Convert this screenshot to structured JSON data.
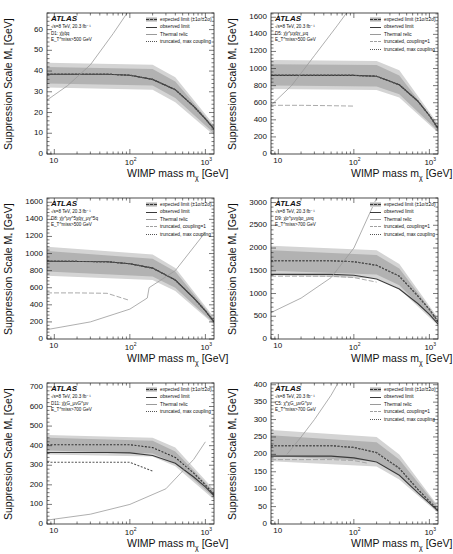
{
  "chart_data": [
    {
      "type": "line",
      "panel": "D1",
      "title": "",
      "atlas_label": "ATLAS",
      "info_lines": [
        "√s=8 TeV, 20.3 fb⁻¹",
        "D1: χ̄χq̄q",
        "E_T^miss>500 GeV"
      ],
      "xlabel": "WIMP mass m_χ [GeV]",
      "ylabel": "Suppression Scale M* [GeV]",
      "xscale": "log",
      "xlim": [
        8,
        1300
      ],
      "ylim": [
        0,
        68
      ],
      "xticks": [
        "10",
        "10²",
        "10³"
      ],
      "yticks": [
        0,
        10,
        20,
        30,
        40,
        50,
        60
      ],
      "legend": [
        "expected limit (±1σ/±2σ)",
        "observed limit",
        "Thermal relic",
        "truncated, max coupling"
      ],
      "series": [
        {
          "name": "expected limit",
          "x": [
            8,
            10,
            50,
            100,
            200,
            400,
            700,
            1000,
            1300
          ],
          "values": [
            38.5,
            38.5,
            38.5,
            38,
            36,
            31,
            23,
            17,
            12
          ]
        },
        {
          "name": "observed limit",
          "x": [
            8,
            10,
            50,
            100,
            200,
            400,
            700,
            1000,
            1300
          ],
          "values": [
            38.5,
            38.5,
            38.5,
            38,
            36,
            31,
            23,
            17,
            12
          ]
        },
        {
          "name": "truncated, max coupling",
          "x": [
            8,
            10,
            50,
            100,
            200,
            400,
            700,
            1000,
            1300
          ],
          "values": [
            38.5,
            38.5,
            38.5,
            38,
            36,
            31,
            23,
            17,
            12
          ]
        },
        {
          "name": "Thermal relic",
          "x": [
            8,
            15,
            30,
            60,
            100
          ],
          "values": [
            26,
            33,
            43,
            58,
            70
          ]
        }
      ],
      "band_1sigma": {
        "x": [
          8,
          200,
          400,
          1300
        ],
        "upper": [
          42,
          41,
          35,
          13
        ],
        "lower": [
          34,
          33,
          27,
          10
        ]
      },
      "band_2sigma": {
        "x": [
          8,
          200,
          400,
          1300
        ],
        "upper": [
          44,
          43,
          37,
          14
        ],
        "lower": [
          32,
          31,
          25,
          9
        ]
      }
    },
    {
      "type": "line",
      "panel": "D5",
      "atlas_label": "ATLAS",
      "info_lines": [
        "√s=8 TeV, 20.3 fb⁻¹",
        "D5: χ̄γ^μχq̄γ_μq",
        "E_T^miss>500 GeV"
      ],
      "xlabel": "WIMP mass m_χ [GeV]",
      "ylabel": "Suppression Scale M* [GeV]",
      "xscale": "log",
      "xlim": [
        8,
        1300
      ],
      "ylim": [
        0,
        1650
      ],
      "xticks": [
        "10",
        "10²",
        "10³"
      ],
      "yticks": [
        0,
        200,
        400,
        600,
        800,
        1000,
        1200,
        1400,
        1600
      ],
      "legend": [
        "expected limit (±1σ/±2σ)",
        "observed limit",
        "Thermal relic",
        "truncated, coupling=1",
        "truncated, max coupling"
      ],
      "series": [
        {
          "name": "expected limit",
          "x": [
            8,
            10,
            50,
            100,
            200,
            400,
            700,
            1000,
            1300
          ],
          "values": [
            920,
            920,
            920,
            920,
            910,
            810,
            620,
            450,
            300
          ]
        },
        {
          "name": "observed limit",
          "x": [
            8,
            10,
            50,
            100,
            200,
            400,
            700,
            1000,
            1300
          ],
          "values": [
            920,
            920,
            920,
            920,
            910,
            810,
            620,
            450,
            300
          ]
        },
        {
          "name": "truncated, coupling=1",
          "x": [
            8,
            20,
            50,
            100
          ],
          "values": [
            570,
            570,
            565,
            560
          ]
        },
        {
          "name": "truncated, max coupling",
          "x": [
            8,
            10,
            50,
            100,
            200,
            400,
            700,
            1000,
            1300
          ],
          "values": [
            920,
            920,
            920,
            920,
            910,
            810,
            620,
            450,
            300
          ]
        },
        {
          "name": "Thermal relic",
          "x": [
            8,
            15,
            30,
            60,
            80
          ],
          "values": [
            570,
            800,
            1150,
            1500,
            1650
          ]
        }
      ],
      "band_1sigma": {
        "x": [
          8,
          200,
          400,
          1300
        ],
        "upper": [
          1050,
          1040,
          920,
          330
        ],
        "lower": [
          800,
          790,
          700,
          270
        ]
      },
      "band_2sigma": {
        "x": [
          8,
          200,
          400,
          1300
        ],
        "upper": [
          1100,
          1090,
          980,
          350
        ],
        "lower": [
          760,
          750,
          660,
          250
        ]
      }
    },
    {
      "type": "line",
      "panel": "D8",
      "atlas_label": "ATLAS",
      "info_lines": [
        "√s=8 TeV, 20.3 fb⁻¹",
        "D8: χ̄γ^μγ^5χq̄γ_μγ^5q",
        "E_T^miss>500 GeV"
      ],
      "xlabel": "WIMP mass m_χ [GeV]",
      "ylabel": "Suppression Scale M* [GeV]",
      "xscale": "log",
      "xlim": [
        8,
        1300
      ],
      "ylim": [
        0,
        1650
      ],
      "xticks": [
        "10",
        "10²",
        "10³"
      ],
      "yticks": [
        0,
        200,
        400,
        600,
        800,
        1000,
        1200,
        1400,
        1600
      ],
      "legend": [
        "expected limit (±1σ/±2σ)",
        "observed limit",
        "Thermal relic",
        "truncated, coupling=1",
        "truncated, max coupling"
      ],
      "series": [
        {
          "name": "expected limit",
          "x": [
            8,
            10,
            50,
            100,
            200,
            400,
            700,
            1000,
            1300
          ],
          "values": [
            910,
            910,
            905,
            880,
            830,
            690,
            480,
            330,
            200
          ]
        },
        {
          "name": "observed limit",
          "x": [
            8,
            10,
            50,
            100,
            200,
            400,
            700,
            1000,
            1300
          ],
          "values": [
            910,
            910,
            905,
            880,
            830,
            690,
            480,
            330,
            200
          ]
        },
        {
          "name": "truncated, coupling=1",
          "x": [
            8,
            20,
            50,
            100
          ],
          "values": [
            540,
            540,
            535,
            450
          ]
        },
        {
          "name": "truncated, max coupling",
          "x": [
            8,
            10,
            50,
            100,
            200,
            400,
            700,
            1000,
            1300
          ],
          "values": [
            910,
            910,
            905,
            880,
            830,
            690,
            480,
            330,
            200
          ]
        },
        {
          "name": "Thermal relic",
          "x": [
            8,
            30,
            100,
            170,
            180,
            400,
            1000
          ],
          "values": [
            110,
            200,
            350,
            480,
            600,
            800,
            1250
          ]
        }
      ],
      "band_1sigma": {
        "x": [
          8,
          200,
          400,
          1300
        ],
        "upper": [
          1030,
          940,
          790,
          230
        ],
        "lower": [
          790,
          730,
          600,
          180
        ]
      },
      "band_2sigma": {
        "x": [
          8,
          200,
          400,
          1300
        ],
        "upper": [
          1080,
          990,
          830,
          250
        ],
        "lower": [
          740,
          690,
          560,
          170
        ]
      }
    },
    {
      "type": "line",
      "panel": "D9",
      "atlas_label": "ATLAS",
      "info_lines": [
        "√s=8 TeV, 20.3 fb⁻¹",
        "D9: χ̄σ^μνχq̄σ_μνq",
        "E_T^miss>700 GeV"
      ],
      "xlabel": "WIMP mass m_χ [GeV]",
      "ylabel": "Suppression Scale M* [GeV]",
      "xscale": "log",
      "xlim": [
        8,
        1300
      ],
      "ylim": [
        0,
        3100
      ],
      "xticks": [
        "10",
        "10²",
        "10³"
      ],
      "yticks": [
        0,
        500,
        1000,
        1500,
        2000,
        2500,
        3000
      ],
      "legend": [
        "expected limit (±1σ/±2σ)",
        "observed limit",
        "Thermal relic",
        "truncated, coupling=1",
        "truncated, max coupling"
      ],
      "series": [
        {
          "name": "expected limit",
          "x": [
            8,
            10,
            50,
            100,
            200,
            400,
            700,
            1000,
            1300
          ],
          "values": [
            1720,
            1720,
            1720,
            1700,
            1620,
            1380,
            950,
            650,
            380
          ]
        },
        {
          "name": "observed limit",
          "x": [
            8,
            10,
            50,
            100,
            200,
            400,
            700,
            1000,
            1300
          ],
          "values": [
            1420,
            1420,
            1420,
            1400,
            1320,
            1100,
            780,
            540,
            330
          ]
        },
        {
          "name": "truncated, coupling=1",
          "x": [
            8,
            20,
            50,
            100,
            200
          ],
          "values": [
            1380,
            1380,
            1380,
            1350,
            1250
          ]
        },
        {
          "name": "truncated, max coupling",
          "x": [
            8,
            10,
            50,
            100,
            200,
            400,
            700,
            1000,
            1300
          ],
          "values": [
            1720,
            1720,
            1720,
            1700,
            1620,
            1380,
            950,
            650,
            380
          ]
        },
        {
          "name": "Thermal relic",
          "x": [
            8,
            20,
            50,
            100,
            200
          ],
          "values": [
            580,
            900,
            1350,
            2000,
            3100
          ]
        }
      ],
      "band_1sigma": {
        "x": [
          8,
          200,
          400,
          1300
        ],
        "upper": [
          1950,
          1850,
          1550,
          430
        ],
        "lower": [
          1500,
          1420,
          1180,
          330
        ]
      },
      "band_2sigma": {
        "x": [
          8,
          200,
          400,
          1300
        ],
        "upper": [
          2050,
          1950,
          1650,
          460
        ],
        "lower": [
          1400,
          1330,
          1100,
          300
        ]
      }
    },
    {
      "type": "line",
      "panel": "D11",
      "atlas_label": "ATLAS",
      "info_lines": [
        "√s=8 TeV, 20.3 fb⁻¹",
        "D11: χ̄χG_μνG^μν",
        "E_T^miss>700 GeV"
      ],
      "xlabel": "WIMP mass m_χ [GeV]",
      "ylabel": "Suppression Scale M* [GeV]",
      "xscale": "log",
      "xlim": [
        8,
        1300
      ],
      "ylim": [
        0,
        720
      ],
      "xticks": [
        "10",
        "10²",
        "10³"
      ],
      "yticks": [
        0,
        100,
        200,
        300,
        400,
        500,
        600,
        700
      ],
      "legend": [
        "expected limit (±1σ/±2σ)",
        "observed limit",
        "Thermal relic",
        "truncated, max coupling"
      ],
      "series": [
        {
          "name": "expected limit",
          "x": [
            8,
            10,
            50,
            100,
            200,
            400,
            700,
            1000,
            1300
          ],
          "values": [
            405,
            405,
            405,
            405,
            390,
            340,
            260,
            200,
            150
          ]
        },
        {
          "name": "observed limit",
          "x": [
            8,
            10,
            50,
            100,
            200,
            400,
            700,
            1000,
            1300
          ],
          "values": [
            365,
            365,
            365,
            363,
            350,
            310,
            240,
            190,
            145
          ]
        },
        {
          "name": "truncated, max coupling",
          "x": [
            8,
            20,
            50,
            100,
            200
          ],
          "values": [
            315,
            315,
            315,
            315,
            270
          ]
        },
        {
          "name": "Thermal relic",
          "x": [
            8,
            30,
            100,
            300,
            700,
            1000
          ],
          "values": [
            20,
            50,
            100,
            180,
            330,
            420
          ]
        }
      ],
      "band_1sigma": {
        "x": [
          8,
          200,
          400,
          1300
        ],
        "upper": [
          440,
          425,
          370,
          165
        ],
        "lower": [
          375,
          360,
          310,
          135
        ]
      },
      "band_2sigma": {
        "x": [
          8,
          200,
          400,
          1300
        ],
        "upper": [
          455,
          440,
          390,
          175
        ],
        "lower": [
          355,
          345,
          295,
          125
        ]
      }
    },
    {
      "type": "line",
      "panel": "C5",
      "atlas_label": "ATLAS",
      "info_lines": [
        "√s=8 TeV, 20.3 fb⁻¹",
        "C5: χ*χG_μνG^μν",
        "E_T^miss>700 GeV"
      ],
      "xlabel": "WIMP mass m_χ [GeV]",
      "ylabel": "Suppression Scale M* [GeV]",
      "xscale": "log",
      "xlim": [
        8,
        1300
      ],
      "ylim": [
        0,
        405
      ],
      "xticks": [
        "10",
        "10²",
        "10³"
      ],
      "yticks": [
        0,
        50,
        100,
        150,
        200,
        250,
        300,
        350,
        400
      ],
      "legend": [
        "expected limit (±1σ/±2σ)",
        "observed limit",
        "Thermal relic",
        "truncated, coupling=1",
        "truncated, max coupling"
      ],
      "series": [
        {
          "name": "expected limit",
          "x": [
            8,
            10,
            50,
            100,
            200,
            400,
            700,
            1000,
            1300
          ],
          "values": [
            225,
            225,
            225,
            220,
            205,
            160,
            100,
            65,
            40
          ]
        },
        {
          "name": "observed limit",
          "x": [
            8,
            10,
            50,
            100,
            200,
            400,
            700,
            1000,
            1300
          ],
          "values": [
            195,
            195,
            195,
            190,
            178,
            140,
            90,
            60,
            38
          ]
        },
        {
          "name": "truncated, coupling=1",
          "x": [
            8,
            20,
            50,
            100,
            150
          ],
          "values": [
            185,
            185,
            185,
            182,
            175
          ]
        },
        {
          "name": "truncated, max coupling",
          "x": [
            8,
            10,
            50,
            100,
            200,
            400,
            700,
            1000,
            1300
          ],
          "values": [
            225,
            225,
            225,
            220,
            205,
            160,
            100,
            65,
            40
          ]
        },
        {
          "name": "Thermal relic",
          "x": [
            13,
            20,
            30,
            50,
            60
          ],
          "values": [
            200,
            250,
            300,
            370,
            400
          ]
        }
      ],
      "band_1sigma": {
        "x": [
          8,
          200,
          400,
          1300
        ],
        "upper": [
          255,
          235,
          185,
          48
        ],
        "lower": [
          195,
          180,
          140,
          35
        ]
      },
      "band_2sigma": {
        "x": [
          8,
          200,
          400,
          1300
        ],
        "upper": [
          270,
          250,
          200,
          52
        ],
        "lower": [
          180,
          165,
          128,
          32
        ]
      }
    }
  ],
  "common": {
    "xlabel": "WIMP mass m",
    "xlabel_sub": "χ",
    "xlabel_unit": " [GeV]",
    "ylabel": "Suppression Scale M",
    "ylabel_sub": "*",
    "ylabel_unit": " [GeV]",
    "xtick_labels": [
      "10",
      "10",
      "10"
    ],
    "xtick_sups": [
      "",
      "2",
      "3"
    ],
    "colors": {
      "band2": "#d4d4d4",
      "band1": "#b2b2b2",
      "expected": "#333333",
      "observed": "#3a3a3a",
      "relic": "#9a9a9a",
      "trunc1": "#a0a0a0",
      "truncmax": "#555555"
    }
  }
}
